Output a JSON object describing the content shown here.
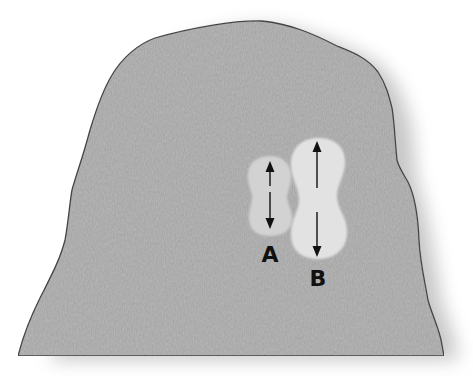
{
  "figure": {
    "colors": {
      "background": "#ffffff",
      "shape_fill": "#b9b9b9",
      "shape_outline": "#4a4a4a",
      "region_a_fill": "#d2d2d2",
      "region_b_fill": "#e2e2e2",
      "arrow": "#111111",
      "label": "#111111"
    },
    "regions": [
      {
        "id": "A",
        "label": "A",
        "arrow": "double-headed vertical"
      },
      {
        "id": "B",
        "label": "B",
        "arrow": "double-headed vertical"
      }
    ]
  }
}
